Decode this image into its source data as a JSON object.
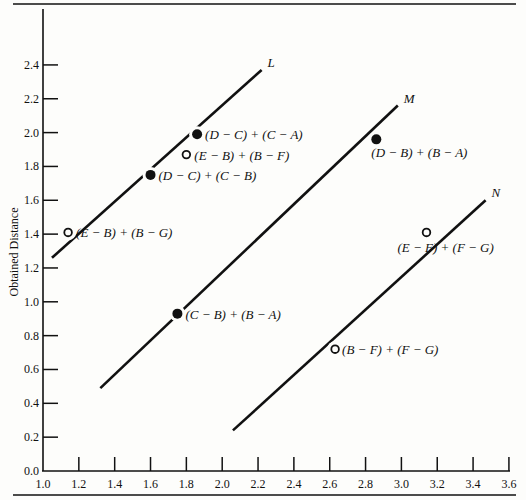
{
  "chart_data": {
    "type": "scatter",
    "title": "",
    "xlabel": "",
    "ylabel": "Obtained Distance",
    "xlim": [
      1.0,
      3.6
    ],
    "ylim": [
      0.0,
      2.5
    ],
    "x_ticks": [
      "1.0",
      "1.2",
      "1.4",
      "1.6",
      "1.8",
      "2.0",
      "2.2",
      "2.4",
      "2.6",
      "2.8",
      "3.0",
      "3.2",
      "3.4",
      "3.6"
    ],
    "y_ticks": [
      "0.0",
      "0.2",
      "0.4",
      "0.6",
      "0.8",
      "1.0",
      "1.2",
      "1.4",
      "1.6",
      "1.8",
      "2.0",
      "2.2",
      "2.4"
    ],
    "grid": false,
    "lines": [
      {
        "name": "L",
        "x": [
          1.05,
          2.22
        ],
        "y": [
          1.26,
          2.37
        ]
      },
      {
        "name": "M",
        "x": [
          1.32,
          2.98
        ],
        "y": [
          0.49,
          2.16
        ]
      },
      {
        "name": "N",
        "x": [
          2.06,
          3.47
        ],
        "y": [
          0.24,
          1.6
        ]
      }
    ],
    "points": [
      {
        "label": "(D − C) + (C − A)",
        "x": 1.86,
        "y": 1.99,
        "marker": "filled",
        "line": "L"
      },
      {
        "label": "(E − B) + (B − F)",
        "x": 1.8,
        "y": 1.87,
        "marker": "open",
        "line": "L"
      },
      {
        "label": "(D − C) + (C − B)",
        "x": 1.6,
        "y": 1.75,
        "marker": "filled",
        "line": "L"
      },
      {
        "label": "(E − B) + (B − G)",
        "x": 1.14,
        "y": 1.41,
        "marker": "open",
        "line": "L"
      },
      {
        "label": "(D − B) + (B − A)",
        "x": 2.86,
        "y": 1.96,
        "marker": "filled",
        "line": "M"
      },
      {
        "label": "(C − B) + (B − A)",
        "x": 1.75,
        "y": 0.93,
        "marker": "filled",
        "line": "M"
      },
      {
        "label": "(E − F) + (F − G)",
        "x": 3.14,
        "y": 1.41,
        "marker": "open",
        "line": "N"
      },
      {
        "label": "(B − F) + (F − G)",
        "x": 2.63,
        "y": 0.72,
        "marker": "open",
        "line": "N"
      }
    ],
    "legend": null
  }
}
